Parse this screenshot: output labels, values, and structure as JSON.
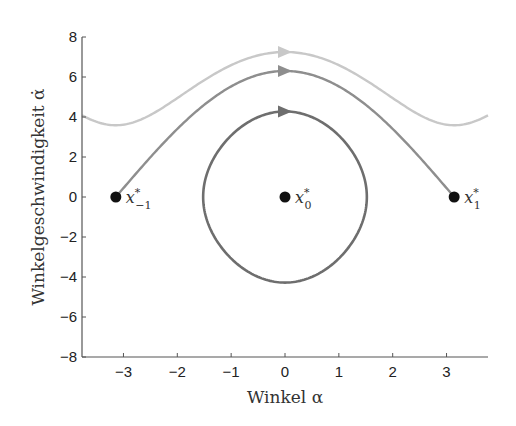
{
  "chart_data": {
    "type": "line",
    "title": "",
    "xlabel": "Winkel α",
    "ylabel": "Winkelgeschwindigkeit α̇",
    "xlim": [
      -3.77,
      3.77
    ],
    "ylim": [
      -8,
      8
    ],
    "xticks": [
      -3,
      -2,
      -1,
      0,
      1,
      2,
      3
    ],
    "xtick_labels": [
      "−3",
      "−2",
      "−1",
      "0",
      "1",
      "2",
      "3"
    ],
    "yticks": [
      -8,
      -6,
      -4,
      -2,
      0,
      2,
      4,
      6,
      8
    ],
    "ytick_labels": [
      "−8",
      "−6",
      "−4",
      "−2",
      "0",
      "2",
      "4",
      "6",
      "8"
    ],
    "grid": false,
    "legend": null,
    "series": [
      {
        "name": "rotating trajectory",
        "kind": "open",
        "energy_level": 7.25,
        "color": "#c8c8c8",
        "x_range": [
          -3.77,
          3.77
        ],
        "arrow_at_x": 0
      },
      {
        "name": "separatrix",
        "kind": "heteroclinic",
        "energy_level": 6.3,
        "color": "#8e8e8e",
        "x_range": [
          -3.1416,
          3.1416
        ],
        "arrow_at_x": 0
      },
      {
        "name": "closed orbit",
        "kind": "closed",
        "amplitude_x": 1.52,
        "amplitude_y": 4.28,
        "color": "#6e6e6e",
        "arrow_at_x": 0
      }
    ],
    "points": [
      {
        "id": "x_-1",
        "x": -3.1416,
        "y": 0,
        "label": "x",
        "sup": "*",
        "sub": "−1"
      },
      {
        "id": "x_0",
        "x": 0,
        "y": 0,
        "label": "x",
        "sup": "*",
        "sub": "0"
      },
      {
        "id": "x_1",
        "x": 3.1416,
        "y": 0,
        "label": "x",
        "sup": "*",
        "sub": "1"
      }
    ]
  }
}
